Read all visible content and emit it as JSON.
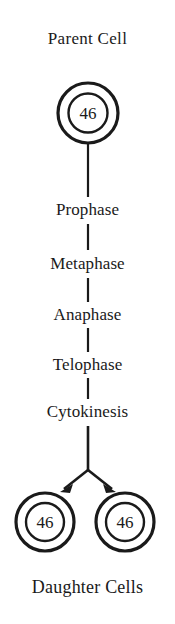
{
  "diagram": {
    "title": "Parent Cell",
    "footer": "Daughter Cells",
    "parent_cell": {
      "chromosome_count": "46"
    },
    "phases": [
      {
        "label": "Prophase"
      },
      {
        "label": "Metaphase"
      },
      {
        "label": "Anaphase"
      },
      {
        "label": "Telophase"
      },
      {
        "label": "Cytokinesis"
      }
    ],
    "daughter_cells": [
      {
        "chromosome_count": "46"
      },
      {
        "chromosome_count": "46"
      }
    ],
    "colors": {
      "background": "#ffffff",
      "stroke": "#1a1a1a",
      "text": "#1a1a1a"
    }
  }
}
